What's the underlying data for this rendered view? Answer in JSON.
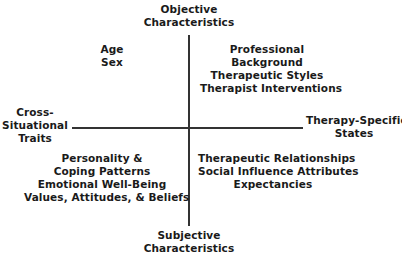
{
  "diagram": {
    "axes": {
      "top": [
        "Objective",
        "Characteristics"
      ],
      "bottom": [
        "Subjective",
        "Characteristics"
      ],
      "left": [
        "Cross-",
        "Situational",
        "Traits"
      ],
      "right": [
        "Therapy-Specific",
        "States"
      ]
    },
    "quadrants": {
      "top_left": [
        "Age",
        "Sex"
      ],
      "top_right": [
        "Professional",
        "Background",
        "Therapeutic Styles",
        "Therapist Interventions"
      ],
      "bottom_left": [
        "Personality &",
        "Coping Patterns",
        "Emotional Well-Being",
        "Values, Attitudes, & Beliefs"
      ],
      "bottom_right": [
        "Therapeutic Relationships",
        "Social Influence Attributes",
        "Expectancies"
      ]
    },
    "line_color": "#333333"
  }
}
